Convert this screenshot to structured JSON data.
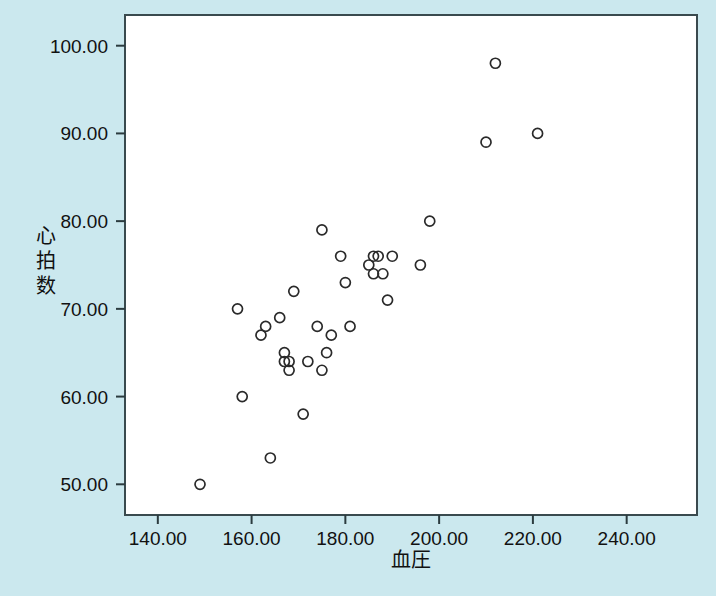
{
  "chart_data": {
    "type": "scatter",
    "title": "",
    "xlabel": "血圧",
    "ylabel": "心拍数",
    "xlim": [
      133,
      255
    ],
    "ylim": [
      46.5,
      103.5
    ],
    "grid": false,
    "legend": "none",
    "marker": "open-circle",
    "xticks": [
      140,
      160,
      180,
      200,
      220,
      240
    ],
    "yticks": [
      50,
      60,
      70,
      80,
      90,
      100
    ],
    "xtick_labels": [
      "140.00",
      "160.00",
      "180.00",
      "200.00",
      "220.00",
      "240.00"
    ],
    "ytick_labels": [
      "50.00",
      "60.00",
      "70.00",
      "80.00",
      "90.00",
      "100.00"
    ],
    "x": [
      149,
      157,
      158,
      162,
      163,
      164,
      166,
      167,
      167,
      168,
      168,
      169,
      171,
      172,
      174,
      175,
      175,
      176,
      177,
      179,
      180,
      181,
      185,
      186,
      186,
      187,
      188,
      189,
      190,
      196,
      198,
      210,
      212,
      221
    ],
    "y": [
      50,
      70,
      60,
      67,
      68,
      53,
      69,
      64,
      65,
      63,
      64,
      72,
      58,
      64,
      68,
      79,
      63,
      65,
      67,
      76,
      73,
      68,
      75,
      76,
      74,
      76,
      74,
      71,
      76,
      75,
      80,
      89,
      98,
      90
    ],
    "points": [
      {
        "x": 149,
        "y": 50
      },
      {
        "x": 157,
        "y": 70
      },
      {
        "x": 158,
        "y": 60
      },
      {
        "x": 162,
        "y": 67
      },
      {
        "x": 163,
        "y": 68
      },
      {
        "x": 164,
        "y": 53
      },
      {
        "x": 166,
        "y": 69
      },
      {
        "x": 167,
        "y": 64
      },
      {
        "x": 167,
        "y": 65
      },
      {
        "x": 168,
        "y": 63
      },
      {
        "x": 168,
        "y": 64
      },
      {
        "x": 169,
        "y": 72
      },
      {
        "x": 171,
        "y": 58
      },
      {
        "x": 172,
        "y": 64
      },
      {
        "x": 174,
        "y": 68
      },
      {
        "x": 175,
        "y": 79
      },
      {
        "x": 175,
        "y": 63
      },
      {
        "x": 176,
        "y": 65
      },
      {
        "x": 177,
        "y": 67
      },
      {
        "x": 179,
        "y": 76
      },
      {
        "x": 180,
        "y": 73
      },
      {
        "x": 181,
        "y": 68
      },
      {
        "x": 185,
        "y": 75
      },
      {
        "x": 186,
        "y": 76
      },
      {
        "x": 186,
        "y": 74
      },
      {
        "x": 187,
        "y": 76
      },
      {
        "x": 188,
        "y": 74
      },
      {
        "x": 189,
        "y": 71
      },
      {
        "x": 190,
        "y": 76
      },
      {
        "x": 196,
        "y": 75
      },
      {
        "x": 198,
        "y": 80
      },
      {
        "x": 210,
        "y": 89
      },
      {
        "x": 212,
        "y": 98
      },
      {
        "x": 221,
        "y": 90
      }
    ],
    "colors": {
      "background": "#cbe8ee",
      "plot_area": "#ffffff",
      "marker_stroke": "#2a2a2a",
      "axis": "#3a4a4e",
      "text": "#111111"
    }
  }
}
